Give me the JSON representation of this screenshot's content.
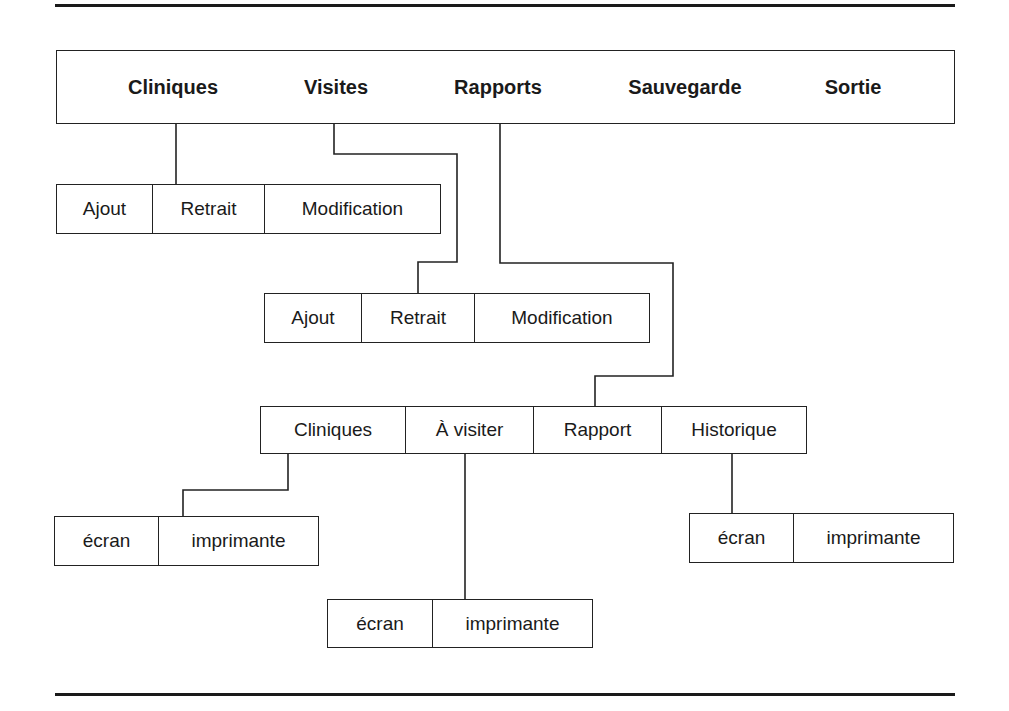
{
  "main_menu": {
    "items": [
      {
        "label": "Cliniques"
      },
      {
        "label": "Visites"
      },
      {
        "label": "Rapports"
      },
      {
        "label": "Sauvegarde"
      },
      {
        "label": "Sortie"
      }
    ]
  },
  "cliniques_submenu": {
    "items": [
      {
        "label": "Ajout"
      },
      {
        "label": "Retrait"
      },
      {
        "label": "Modification"
      }
    ]
  },
  "visites_submenu": {
    "items": [
      {
        "label": "Ajout"
      },
      {
        "label": "Retrait"
      },
      {
        "label": "Modification"
      }
    ]
  },
  "rapports_submenu": {
    "items": [
      {
        "label": "Cliniques"
      },
      {
        "label": "À visiter"
      },
      {
        "label": "Rapport"
      },
      {
        "label": "Historique"
      }
    ]
  },
  "rapport_cliniques_output": {
    "items": [
      {
        "label": "écran"
      },
      {
        "label": "imprimante"
      }
    ]
  },
  "rapport_a_visiter_output": {
    "items": [
      {
        "label": "écran"
      },
      {
        "label": "imprimante"
      }
    ]
  },
  "rapport_historique_output": {
    "items": [
      {
        "label": "écran"
      },
      {
        "label": "imprimante"
      }
    ]
  },
  "colors": {
    "line": "#222222",
    "background": "#ffffff",
    "text": "#1a1a1a"
  }
}
